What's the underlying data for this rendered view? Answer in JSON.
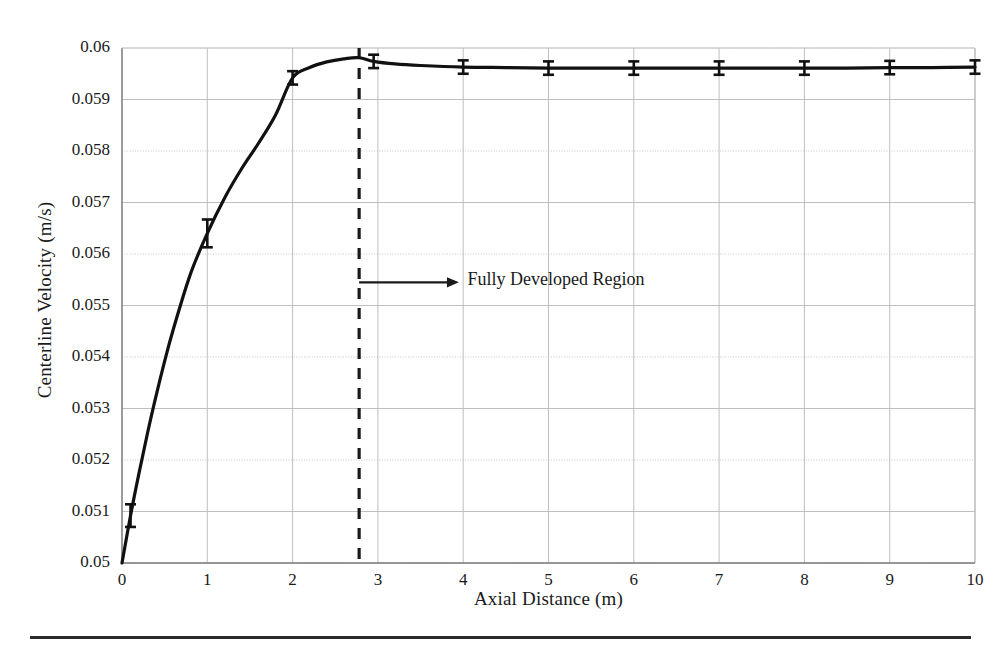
{
  "figure": {
    "background": "#ffffff",
    "line_color": "#111111",
    "grid_color": "#b8b8b8",
    "axis_color": "#777777",
    "rule_color": "#2b2b2b",
    "bottom_rule_label": "figure-bottom-rule"
  },
  "axes": {
    "x_title": "Axial Distance (m)",
    "y_title": "Centerline Velocity (m/s)",
    "x_ticks": [
      "0",
      "1",
      "2",
      "3",
      "4",
      "5",
      "6",
      "7",
      "8",
      "9",
      "10"
    ],
    "y_ticks": [
      "0.05",
      "0.051",
      "0.052",
      "0.053",
      "0.054",
      "0.055",
      "0.056",
      "0.057",
      "0.058",
      "0.059",
      "0.06"
    ]
  },
  "annotations": {
    "fully_developed": {
      "text": "Fully Developed Region",
      "arrow_y_value": 0.05545,
      "arrow_x_start": 2.78,
      "arrow_x_end": 3.95,
      "text_x": 4.05
    },
    "transition_line": {
      "x_value": 2.78,
      "style": "dashed"
    }
  },
  "chart_data": {
    "type": "line",
    "title": "",
    "xlabel": "Axial Distance (m)",
    "ylabel": "Centerline Velocity (m/s)",
    "xlim": [
      0,
      10
    ],
    "ylim": [
      0.05,
      0.06
    ],
    "xticks": [
      0,
      1,
      2,
      3,
      4,
      5,
      6,
      7,
      8,
      9,
      10
    ],
    "yticks": [
      0.05,
      0.051,
      0.052,
      0.053,
      0.054,
      0.055,
      0.056,
      0.057,
      0.058,
      0.059,
      0.06
    ],
    "grid": true,
    "legend": false,
    "series": [
      {
        "name": "Centerline velocity",
        "x": [
          0.0,
          0.1,
          0.2,
          0.3,
          0.4,
          0.5,
          0.6,
          0.8,
          1.0,
          1.2,
          1.4,
          1.6,
          1.8,
          2.0,
          2.2,
          2.4,
          2.6,
          2.78,
          2.95,
          3.2,
          3.5,
          4.0,
          4.5,
          5.0,
          5.5,
          6.0,
          6.5,
          7.0,
          7.5,
          8.0,
          8.5,
          9.0,
          9.5,
          10.0
        ],
        "y": [
          0.05,
          0.05092,
          0.05175,
          0.05253,
          0.05325,
          0.05392,
          0.05453,
          0.0556,
          0.0564,
          0.05708,
          0.05765,
          0.05815,
          0.0587,
          0.05942,
          0.05962,
          0.05973,
          0.05979,
          0.05981,
          0.05974,
          0.05969,
          0.05966,
          0.05963,
          0.05962,
          0.05961,
          0.05961,
          0.05961,
          0.05961,
          0.05961,
          0.05961,
          0.05961,
          0.05961,
          0.05962,
          0.05962,
          0.05963
        ]
      }
    ],
    "error_bars": [
      {
        "x": 0.1,
        "y": 0.05092,
        "yerr": 0.00022
      },
      {
        "x": 1.0,
        "y": 0.0564,
        "yerr": 0.00027
      },
      {
        "x": 2.0,
        "y": 0.05942,
        "yerr": 0.00013
      },
      {
        "x": 2.95,
        "y": 0.05974,
        "yerr": 0.00013
      },
      {
        "x": 4.0,
        "y": 0.05963,
        "yerr": 0.00013
      },
      {
        "x": 5.0,
        "y": 0.05961,
        "yerr": 0.00013
      },
      {
        "x": 6.0,
        "y": 0.05961,
        "yerr": 0.00013
      },
      {
        "x": 7.0,
        "y": 0.05961,
        "yerr": 0.00013
      },
      {
        "x": 8.0,
        "y": 0.05961,
        "yerr": 0.00013
      },
      {
        "x": 9.0,
        "y": 0.05962,
        "yerr": 0.00013
      },
      {
        "x": 10.0,
        "y": 0.05963,
        "yerr": 0.00013
      }
    ],
    "annotations": [
      {
        "text": "Fully Developed Region",
        "x": 4.05,
        "y": 0.05545,
        "arrow_from_x": 2.78,
        "arrow_to_x": 3.95
      },
      {
        "type": "vline",
        "x": 2.78,
        "style": "dashed"
      }
    ]
  }
}
